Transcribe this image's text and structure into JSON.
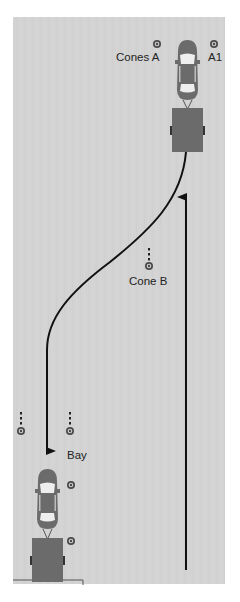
{
  "diagram": {
    "colors": {
      "ground": "#d3d3d3",
      "vehicle": "#6b6b6b",
      "glass": "#eeeeee",
      "path": "#111111",
      "cone": "#555555"
    },
    "labels": {
      "cones_a": "Cones A",
      "a1": "A1",
      "cone_b": "Cone B",
      "bay": "Bay"
    },
    "vehicles": [
      {
        "name": "start-car-with-trailer",
        "position": "top-right",
        "facing": "up"
      },
      {
        "name": "end-car-with-trailer",
        "position": "bottom-left-bay",
        "facing": "up"
      }
    ],
    "paths": [
      {
        "name": "forward-path",
        "direction": "up",
        "description": "straight line from bottom up to trailer start"
      },
      {
        "name": "reverse-path",
        "direction": "down",
        "description": "curved path from top trailer to bay"
      }
    ],
    "cones": [
      {
        "id": "cones-a-left",
        "x": 157,
        "y": 44
      },
      {
        "id": "cones-a-right-a1",
        "x": 214,
        "y": 44
      },
      {
        "id": "cone-b",
        "x": 149,
        "y": 266
      },
      {
        "id": "bay-left-outer",
        "x": 21,
        "y": 431
      },
      {
        "id": "bay-left-inner",
        "x": 70,
        "y": 431
      },
      {
        "id": "bay-side-1",
        "x": 71,
        "y": 485
      },
      {
        "id": "bay-side-2",
        "x": 71,
        "y": 541
      }
    ]
  }
}
